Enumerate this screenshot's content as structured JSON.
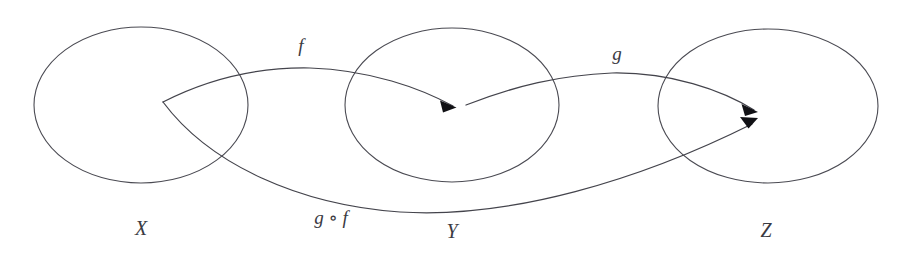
{
  "diagram": {
    "background_color": "#ffffff",
    "stroke_color": "#44444c",
    "label_color": "#3a3a42",
    "width": 905,
    "height": 261
  },
  "sets": [
    {
      "id": "X",
      "label": "X",
      "label_x": 141,
      "label_y": 235,
      "cx": 141,
      "cy": 105,
      "rx": 107,
      "ry": 78
    },
    {
      "id": "Y",
      "label": "Y",
      "label_x": 452,
      "label_y": 238,
      "cx": 452,
      "cy": 105,
      "rx": 107,
      "ry": 77
    },
    {
      "id": "Z",
      "label": "Z",
      "label_x": 766,
      "label_y": 237,
      "cx": 768,
      "cy": 106,
      "rx": 110,
      "ry": 77
    }
  ],
  "morphisms": [
    {
      "id": "f",
      "label": "f",
      "label_x": 301,
      "label_y": 52,
      "source_set": "X",
      "target_set": "Y",
      "source_point": [
        163,
        102
      ],
      "target_point": [
        455,
        107
      ],
      "path": "M 163 102 C 210 78 258 67 310 68 C 370 70 420 88 453 106"
    },
    {
      "id": "g",
      "label": "g",
      "label_x": 617,
      "label_y": 60,
      "source_set": "Y",
      "target_set": "Z",
      "source_point": [
        466,
        105
      ],
      "target_point": [
        757,
        111
      ],
      "path": "M 466 105 C 515 86 560 75 612 73 C 670 72 722 90 754 110"
    },
    {
      "id": "gf",
      "label": "g ∘ f",
      "label_x": 331,
      "label_y": 224,
      "source_set": "X",
      "target_set": "Z",
      "source_point": [
        163,
        102
      ],
      "target_point": [
        757,
        123
      ],
      "path": "M 163 102 C 210 165 300 205 400 212 C 510 219 640 180 752 124"
    }
  ],
  "nodes": [
    {
      "id": "y-point",
      "set": "Y",
      "x": 455,
      "y": 107
    },
    {
      "id": "z-point",
      "set": "Z",
      "x": 757,
      "y": 117
    }
  ]
}
